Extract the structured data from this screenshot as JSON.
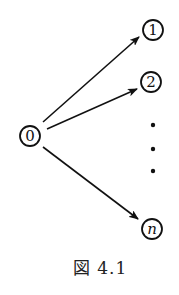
{
  "diagram": {
    "type": "star graph",
    "stroke_color": "#111111",
    "background": "#ffffff",
    "nodes": [
      {
        "id": "0",
        "label": "0",
        "cx": 30,
        "cy": 136,
        "r": 10,
        "italic": false
      },
      {
        "id": "1",
        "label": "1",
        "cx": 153,
        "cy": 30,
        "r": 10,
        "italic": false
      },
      {
        "id": "2",
        "label": "2",
        "cx": 151,
        "cy": 82,
        "r": 10,
        "italic": false
      },
      {
        "id": "n",
        "label": "n",
        "cx": 152,
        "cy": 229,
        "r": 10,
        "italic": true
      }
    ],
    "edges": [
      {
        "from": "0",
        "to": "1",
        "x1": 43,
        "y1": 122,
        "x2": 139,
        "y2": 37
      },
      {
        "from": "0",
        "to": "2",
        "x1": 47,
        "y1": 129,
        "x2": 137,
        "y2": 89
      },
      {
        "from": "0",
        "to": "n",
        "x1": 43,
        "y1": 147,
        "x2": 138,
        "y2": 219
      }
    ],
    "ellipsis_dots": [
      {
        "cx": 153,
        "cy": 125
      },
      {
        "cx": 153,
        "cy": 149
      },
      {
        "cx": 153,
        "cy": 171
      }
    ],
    "caption": "図 4.1"
  }
}
